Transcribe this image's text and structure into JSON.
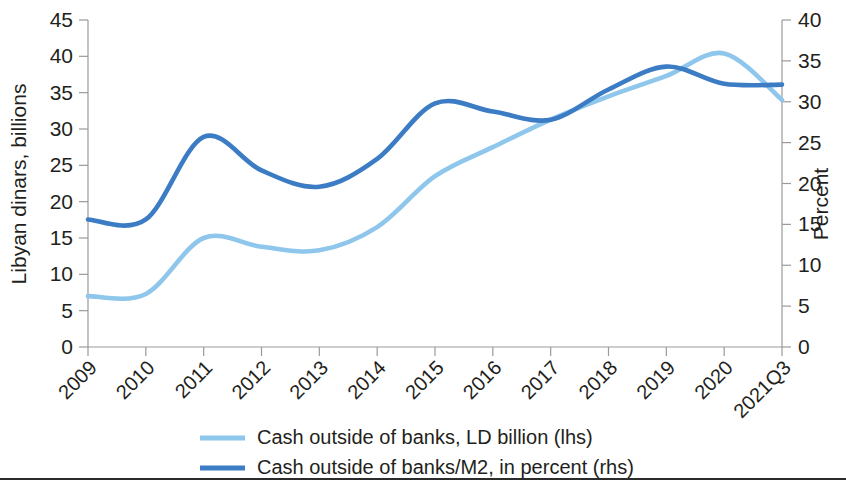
{
  "chart_data": {
    "type": "line",
    "title": "",
    "subtitle": "",
    "xlabel": "",
    "ylabel": "Libyan dinars, billions",
    "y2label": "Percent",
    "grid": false,
    "legend_position": "bottom",
    "categories": [
      "2009",
      "2010",
      "2011",
      "2012",
      "2013",
      "2014",
      "2015",
      "2016",
      "2017",
      "2018",
      "2019",
      "2020",
      "2021Q3"
    ],
    "ylim": [
      0,
      45
    ],
    "yticks": [
      "0",
      "5",
      "10",
      "15",
      "20",
      "25",
      "30",
      "35",
      "40",
      "45"
    ],
    "y2lim": [
      0,
      40
    ],
    "y2ticks": [
      "0",
      "5",
      "10",
      "15",
      "20",
      "25",
      "30",
      "35",
      "40"
    ],
    "series": [
      {
        "name": "Cash outside of banks, LD billion (lhs)",
        "axis": "left",
        "color": "#8ec6ec",
        "values": [
          7.0,
          7.3,
          15.0,
          13.8,
          13.3,
          16.5,
          23.5,
          27.5,
          31.3,
          34.5,
          37.3,
          40.4,
          34.0
        ]
      },
      {
        "name": "Cash outside of banks/M2, in percent (rhs)",
        "axis": "right",
        "color": "#3c7cc4",
        "values": [
          15.6,
          15.6,
          25.7,
          21.6,
          19.6,
          23.0,
          29.8,
          28.8,
          27.8,
          31.5,
          34.3,
          32.2,
          32.1
        ]
      }
    ]
  },
  "legend": {
    "items": [
      {
        "label": "Cash outside of banks, LD billion (lhs)",
        "color": "#8ec6ec"
      },
      {
        "label": "Cash outside of banks/M2, in percent (rhs)",
        "color": "#3c7cc4"
      }
    ]
  }
}
